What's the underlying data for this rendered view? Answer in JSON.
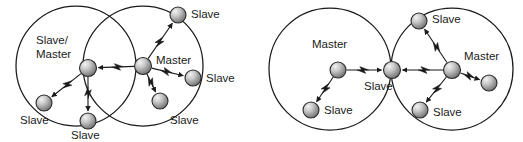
{
  "figure": {
    "background_color": "#ffffff",
    "line_color": "#1a1a1a",
    "node_fill_light": "#d8d8d8",
    "node_fill_dark": "#7a7a7a",
    "node_stroke": "#2b2b2b",
    "label_color": "#1a1a1a"
  },
  "scatternets": [
    {
      "id": "left-scatternet",
      "piconets": [
        {
          "id": "left-piconet-a",
          "cx": 76,
          "cy": 66,
          "r": 60
        },
        {
          "id": "left-piconet-b",
          "cx": 143,
          "cy": 66,
          "r": 60
        }
      ],
      "nodes": [
        {
          "id": "ln-bridge",
          "label": "Slave/\nMaster",
          "line1": "Slave/",
          "line2": "Master",
          "cx": 88,
          "cy": 68,
          "r": 8.5,
          "label_x": 36,
          "label_y": 44,
          "anchor": "start",
          "role": "Slave/Master"
        },
        {
          "id": "ln-master",
          "label": "Master",
          "cx": 143,
          "cy": 66,
          "r": 8.5,
          "label_x": 156,
          "label_y": 64,
          "anchor": "start",
          "role": "Master"
        },
        {
          "id": "ln-slave-1",
          "label": "Slave",
          "cx": 44,
          "cy": 103,
          "r": 8.0,
          "label_x": 20,
          "label_y": 124,
          "anchor": "start",
          "role": "Slave"
        },
        {
          "id": "ln-slave-2",
          "label": "Slave",
          "cx": 88,
          "cy": 121,
          "r": 8.0,
          "label_x": 71,
          "label_y": 139,
          "anchor": "start",
          "role": "Slave"
        },
        {
          "id": "ln-slave-3",
          "label": "Slave",
          "cx": 178,
          "cy": 15,
          "r": 8.0,
          "label_x": 191,
          "label_y": 18,
          "anchor": "start",
          "role": "Slave"
        },
        {
          "id": "ln-slave-4",
          "label": "Slave",
          "cx": 193,
          "cy": 78,
          "r": 8.0,
          "label_x": 206,
          "label_y": 82,
          "anchor": "start",
          "role": "Slave"
        },
        {
          "id": "ln-slave-5",
          "label": "Slave",
          "cx": 160,
          "cy": 101,
          "r": 8.0,
          "label_x": 170,
          "label_y": 124,
          "anchor": "start",
          "role": "Slave"
        }
      ],
      "links": [
        {
          "from": "ln-master",
          "to": "ln-bridge",
          "bolt": true,
          "arrow": true
        },
        {
          "from": "ln-bridge",
          "to": "ln-slave-1",
          "bolt": true,
          "arrow": true
        },
        {
          "from": "ln-bridge",
          "to": "ln-slave-2",
          "bolt": true,
          "arrow": true
        },
        {
          "from": "ln-master",
          "to": "ln-slave-3",
          "bolt": true,
          "arrow": true
        },
        {
          "from": "ln-master",
          "to": "ln-slave-4",
          "bolt": true,
          "arrow": true
        },
        {
          "from": "ln-master",
          "to": "ln-slave-5",
          "bolt": true,
          "arrow": true
        }
      ]
    },
    {
      "id": "right-scatternet",
      "piconets": [
        {
          "id": "right-piconet-a",
          "cx": 330,
          "cy": 69,
          "r": 61
        },
        {
          "id": "right-piconet-b",
          "cx": 452,
          "cy": 69,
          "r": 61
        }
      ],
      "nodes": [
        {
          "id": "rn-master-1",
          "label": "Master",
          "cx": 338,
          "cy": 70,
          "r": 8.0,
          "label_x": 312,
          "label_y": 48,
          "anchor": "start",
          "role": "Master"
        },
        {
          "id": "rn-bridge",
          "label": "Slave",
          "cx": 392,
          "cy": 70,
          "r": 8.5,
          "label_x": 364,
          "label_y": 90,
          "anchor": "start",
          "role": "Slave"
        },
        {
          "id": "rn-slave-1",
          "label": "Slave",
          "cx": 311,
          "cy": 110,
          "r": 8.0,
          "label_x": 324,
          "label_y": 114,
          "anchor": "start",
          "role": "Slave"
        },
        {
          "id": "rn-master-2",
          "label": "Master",
          "cx": 452,
          "cy": 70,
          "r": 8.5,
          "label_x": 464,
          "label_y": 60,
          "anchor": "start",
          "role": "Master"
        },
        {
          "id": "rn-slave-2",
          "label": "Slave",
          "cx": 419,
          "cy": 21,
          "r": 8.0,
          "label_x": 432,
          "label_y": 23,
          "anchor": "start",
          "role": "Slave"
        },
        {
          "id": "rn-slave-3",
          "label": "Slave",
          "cx": 420,
          "cy": 110,
          "r": 8.0,
          "label_x": 433,
          "label_y": 116,
          "anchor": "start",
          "role": "Slave"
        },
        {
          "id": "rn-slave-4",
          "label": "",
          "cx": 489,
          "cy": 83,
          "r": 8.0,
          "label_x": 0,
          "label_y": 0,
          "anchor": "start",
          "role": "Slave"
        }
      ],
      "links": [
        {
          "from": "rn-master-1",
          "to": "rn-bridge",
          "bolt": true,
          "arrow": true
        },
        {
          "from": "rn-master-1",
          "to": "rn-slave-1",
          "bolt": true,
          "arrow": true
        },
        {
          "from": "rn-master-2",
          "to": "rn-bridge",
          "bolt": true,
          "arrow": true
        },
        {
          "from": "rn-master-2",
          "to": "rn-slave-2",
          "bolt": true,
          "arrow": true
        },
        {
          "from": "rn-master-2",
          "to": "rn-slave-3",
          "bolt": true,
          "arrow": true
        },
        {
          "from": "rn-master-2",
          "to": "rn-slave-4",
          "bolt": true,
          "arrow": true
        }
      ]
    }
  ],
  "labels": {
    "master": "Master",
    "slave": "Slave",
    "slave_master_line1": "Slave/",
    "slave_master_line2": "Master"
  }
}
